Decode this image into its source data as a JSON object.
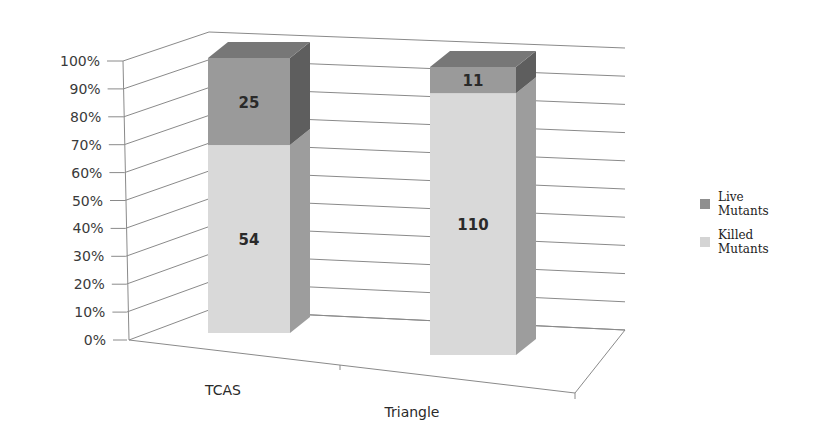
{
  "chart_data": {
    "type": "bar",
    "subtype": "3d-100%-stacked-column",
    "title": "",
    "xlabel": "",
    "ylabel": "",
    "categories": [
      "TCAS",
      "Triangle"
    ],
    "series": [
      {
        "name": "Killed Mutants",
        "values": [
          54,
          110
        ],
        "color": "#d9d9d9"
      },
      {
        "name": "Live Mutants",
        "values": [
          25,
          11
        ],
        "color": "#9a9a9a"
      }
    ],
    "percent_of_total": {
      "TCAS": {
        "Killed Mutants": 68.4,
        "Live Mutants": 31.6
      },
      "Triangle": {
        "Killed Mutants": 90.9,
        "Live Mutants": 9.1
      }
    },
    "ylim": [
      0,
      100
    ],
    "y_ticks": [
      "0%",
      "10%",
      "20%",
      "30%",
      "40%",
      "50%",
      "60%",
      "70%",
      "80%",
      "90%",
      "100%"
    ],
    "grid": true,
    "legend_position": "right"
  },
  "legend": {
    "items": [
      {
        "label_line1": "Live",
        "label_line2": "Mutants",
        "color": "#8f8f8f"
      },
      {
        "label_line1": "Killed",
        "label_line2": "Mutants",
        "color": "#d4d4d4"
      }
    ]
  }
}
